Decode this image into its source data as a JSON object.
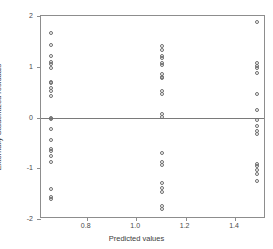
{
  "chart_data": {
    "type": "scatter",
    "title": "",
    "xlabel": "Predicted values",
    "ylabel": "Externally Studentized residuals",
    "xlim": [
      0.615,
      1.525
    ],
    "ylim": [
      -2,
      2
    ],
    "xticks": [
      0.8,
      1.0,
      1.2,
      1.4
    ],
    "xtick_labels": [
      "0.8",
      "1.0",
      "1.2",
      "1.4"
    ],
    "yticks": [
      2,
      1,
      0,
      -1,
      -2
    ],
    "ytick_labels": [
      "2",
      "1",
      "0",
      "-1",
      "-2"
    ],
    "grid": false,
    "legend": null,
    "marker": "open-circle",
    "marker_color": "#6e6e6e",
    "reference_lines": [
      {
        "axis": "y",
        "value": 0,
        "color": "#7a7a7a"
      }
    ],
    "series": [
      {
        "name": "residuals",
        "points": [
          [
            0.655,
            1.66
          ],
          [
            0.655,
            1.43
          ],
          [
            0.655,
            1.22
          ],
          [
            0.655,
            1.1
          ],
          [
            0.655,
            1.06
          ],
          [
            0.655,
            0.97
          ],
          [
            0.655,
            0.7
          ],
          [
            0.655,
            0.67
          ],
          [
            0.655,
            0.58
          ],
          [
            0.655,
            0.52
          ],
          [
            0.655,
            0.43
          ],
          [
            0.655,
            -0.01
          ],
          [
            0.655,
            -0.03
          ],
          [
            0.655,
            -0.22
          ],
          [
            0.655,
            -0.44
          ],
          [
            0.655,
            -0.62
          ],
          [
            0.655,
            -0.66
          ],
          [
            0.655,
            -0.75
          ],
          [
            0.655,
            -0.88
          ],
          [
            0.655,
            -1.41
          ],
          [
            0.655,
            -1.56
          ],
          [
            0.655,
            -1.6
          ],
          [
            1.105,
            1.4
          ],
          [
            1.105,
            1.33
          ],
          [
            1.105,
            1.22
          ],
          [
            1.105,
            1.17
          ],
          [
            1.105,
            1.07
          ],
          [
            1.105,
            1.03
          ],
          [
            1.105,
            0.85
          ],
          [
            1.105,
            0.8
          ],
          [
            1.105,
            0.77
          ],
          [
            1.105,
            0.52
          ],
          [
            1.105,
            0.47
          ],
          [
            1.105,
            0.06
          ],
          [
            1.105,
            0.01
          ],
          [
            1.105,
            -0.69
          ],
          [
            1.105,
            -0.87
          ],
          [
            1.105,
            -0.93
          ],
          [
            1.105,
            -1.29
          ],
          [
            1.105,
            -1.38
          ],
          [
            1.105,
            -1.47
          ],
          [
            1.105,
            -1.74
          ],
          [
            1.105,
            -1.8
          ],
          [
            1.487,
            1.88
          ],
          [
            1.487,
            1.07
          ],
          [
            1.487,
            1.02
          ],
          [
            1.487,
            0.98
          ],
          [
            1.487,
            0.88
          ],
          [
            1.487,
            0.46
          ],
          [
            1.487,
            0.15
          ],
          [
            1.487,
            -0.05
          ],
          [
            1.487,
            -0.16
          ],
          [
            1.487,
            -0.26
          ],
          [
            1.487,
            -0.33
          ],
          [
            1.487,
            -0.92
          ],
          [
            1.487,
            -0.96
          ],
          [
            1.487,
            -1.03
          ],
          [
            1.487,
            -1.12
          ],
          [
            1.487,
            -1.25
          ]
        ]
      }
    ]
  }
}
